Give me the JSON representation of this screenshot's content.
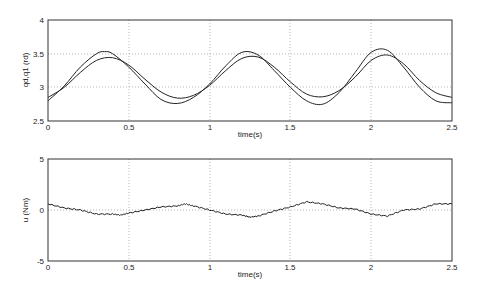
{
  "chart_data": [
    {
      "type": "line",
      "title": "",
      "xlabel": "time(s)",
      "ylabel": "qd,q1 (rd)",
      "xlim": [
        0,
        2.5
      ],
      "ylim": [
        2.5,
        4
      ],
      "xticks": [
        "0",
        "0.5",
        "1",
        "1.5",
        "2",
        "2.5"
      ],
      "yticks": [
        "2.5",
        "3",
        "3.5",
        "4"
      ],
      "grid": true,
      "legend": null,
      "series": [
        {
          "name": "qd",
          "x": [
            0,
            0.1,
            0.2,
            0.3,
            0.35,
            0.4,
            0.5,
            0.6,
            0.7,
            0.8,
            0.9,
            1.0,
            1.1,
            1.2,
            1.3,
            1.4,
            1.5,
            1.6,
            1.7,
            1.8,
            1.9,
            2.0,
            2.1,
            2.2,
            2.3,
            2.4,
            2.5
          ],
          "values": [
            2.8,
            3.02,
            3.3,
            3.5,
            3.53,
            3.5,
            3.3,
            3.05,
            2.82,
            2.76,
            2.85,
            3.05,
            3.32,
            3.52,
            3.48,
            3.25,
            3.0,
            2.8,
            2.75,
            2.92,
            3.22,
            3.52,
            3.55,
            3.3,
            3.0,
            2.8,
            2.77
          ]
        },
        {
          "name": "q1",
          "x": [
            0,
            0.1,
            0.2,
            0.3,
            0.4,
            0.5,
            0.6,
            0.7,
            0.8,
            0.9,
            1.0,
            1.1,
            1.2,
            1.3,
            1.4,
            1.5,
            1.6,
            1.7,
            1.8,
            1.9,
            2.0,
            2.1,
            2.2,
            2.3,
            2.4,
            2.5
          ],
          "values": [
            2.85,
            3.0,
            3.22,
            3.4,
            3.44,
            3.33,
            3.12,
            2.93,
            2.84,
            2.88,
            3.03,
            3.25,
            3.43,
            3.45,
            3.3,
            3.08,
            2.9,
            2.86,
            2.95,
            3.15,
            3.4,
            3.48,
            3.35,
            3.1,
            2.92,
            2.85
          ]
        }
      ]
    },
    {
      "type": "line",
      "title": "",
      "xlabel": "time(s)",
      "ylabel": "u (Nm)",
      "xlim": [
        0,
        2.5
      ],
      "ylim": [
        -5,
        5
      ],
      "xticks": [
        "0",
        "0.5",
        "1",
        "1.5",
        "2",
        "2.5"
      ],
      "yticks": [
        "-5",
        "0",
        "5"
      ],
      "grid": true,
      "legend": null,
      "series": [
        {
          "name": "u",
          "x": [
            0,
            0.1,
            0.2,
            0.3,
            0.4,
            0.45,
            0.5,
            0.6,
            0.7,
            0.8,
            0.85,
            0.9,
            1.0,
            1.1,
            1.2,
            1.25,
            1.3,
            1.4,
            1.5,
            1.6,
            1.7,
            1.8,
            1.9,
            2.0,
            2.1,
            2.2,
            2.3,
            2.4,
            2.5
          ],
          "values": [
            0.6,
            0.2,
            0.0,
            -0.4,
            -0.4,
            -0.5,
            -0.3,
            0.0,
            0.3,
            0.4,
            0.6,
            0.4,
            0.0,
            -0.4,
            -0.5,
            -0.7,
            -0.6,
            -0.1,
            0.3,
            0.8,
            0.6,
            0.2,
            0.1,
            -0.4,
            -0.6,
            0.0,
            0.1,
            0.6,
            0.6
          ]
        }
      ]
    }
  ],
  "top_plot": {
    "ylabel": "qd,q1 (rd)",
    "xlabel": "time(s)",
    "yticks": [
      "4",
      "3.5",
      "3",
      "2.5"
    ],
    "xticks": [
      "0",
      "0.5",
      "1",
      "1.5",
      "2",
      "2.5"
    ]
  },
  "bottom_plot": {
    "ylabel": "u (Nm)",
    "xlabel": "time(s)",
    "yticks": [
      "5",
      "0",
      "-5"
    ],
    "xticks": [
      "0",
      "0.5",
      "1",
      "1.5",
      "2",
      "2.5"
    ]
  },
  "colors": {
    "line": "#222222",
    "axes": "#333333",
    "grid": "#888888"
  }
}
